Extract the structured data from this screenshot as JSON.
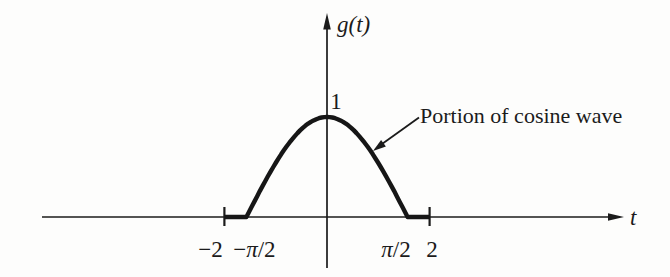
{
  "figure": {
    "ink_color": "#1b1b1b",
    "background_color": "#fdfdfc"
  },
  "chart_data": {
    "type": "line",
    "title": "",
    "xlabel": "t",
    "ylabel": "g(t)",
    "amplitude_label": "1",
    "xlim": [
      -5.55,
      5.8
    ],
    "ylim": [
      -0.5,
      2.04
    ],
    "grid": false,
    "x_ticks": [
      {
        "value": -2,
        "label": "−2",
        "tick_mark": true
      },
      {
        "value": -1.5707963,
        "label": "−π/2",
        "tick_mark": false
      },
      {
        "value": 1.5707963,
        "label": "π/2",
        "tick_mark": false
      },
      {
        "value": 2,
        "label": "2",
        "tick_mark": true
      }
    ],
    "series": [
      {
        "name": "g(t)",
        "definition": "cos(t) for −π/2 ≤ t ≤ π/2; 0 for π/2 < |t| ≤ 2",
        "domain": [
          -2,
          2
        ],
        "cosine_interval": [
          -1.5707963,
          1.5707963
        ],
        "amplitude": 1,
        "peak": {
          "t": 0,
          "value": 1
        }
      }
    ],
    "annotation": {
      "text": "Portion of cosine wave"
    }
  }
}
